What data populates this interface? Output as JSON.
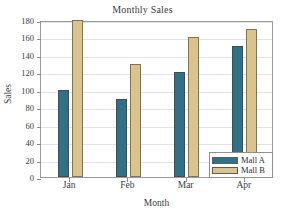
{
  "chart_data": {
    "type": "bar",
    "title": "Monthly Sales",
    "xlabel": "Month",
    "ylabel": "Sales",
    "categories": [
      "Jan",
      "Feb",
      "Mar",
      "Apr"
    ],
    "series": [
      {
        "name": "Mall A",
        "values": [
          100,
          90,
          120,
          150
        ],
        "color": "#2e7189"
      },
      {
        "name": "Mall B",
        "values": [
          180,
          130,
          160,
          170
        ],
        "color": "#dbc38d"
      }
    ],
    "ylim": [
      0,
      180
    ],
    "ytick_labels": [
      "0",
      "20",
      "40",
      "60",
      "80",
      "100",
      "120",
      "140",
      "160",
      "180"
    ],
    "ytick_values": [
      0,
      20,
      40,
      60,
      80,
      100,
      120,
      140,
      160,
      180
    ],
    "grid": true,
    "legend_position": "bottom-right"
  },
  "colors": {
    "series_a": "#2e7189",
    "series_b": "#dbc38d",
    "gridline": "#e3e3e3",
    "frame": "#9a9a9a",
    "background": "#ffffff",
    "text": "#3a3a3a"
  }
}
